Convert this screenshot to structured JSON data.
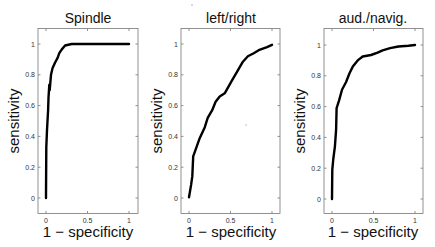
{
  "chart_data": [
    {
      "type": "line",
      "title": "Spindle",
      "xlabel": "1 − specificity",
      "ylabel": "sensitivity",
      "xlim": [
        -0.1,
        1.1
      ],
      "ylim": [
        -0.1,
        1.1
      ],
      "xticks": [
        "0",
        "0.5",
        "1"
      ],
      "yticks": [
        "0",
        "0.2",
        "0.4",
        "0.6",
        "0.8",
        "1"
      ],
      "grid": false,
      "series": [
        {
          "name": "ROC",
          "x": [
            0,
            0,
            0.004,
            0.012,
            0.025,
            0.03,
            0.04,
            0.045,
            0.06,
            0.08,
            0.11,
            0.14,
            0.16,
            0.19,
            0.23,
            0.31,
            0.5,
            1.0
          ],
          "y": [
            0,
            0.02,
            0.33,
            0.44,
            0.57,
            0.65,
            0.735,
            0.7,
            0.8,
            0.845,
            0.88,
            0.91,
            0.94,
            0.965,
            0.99,
            1.0,
            1.0,
            1.0
          ]
        }
      ]
    },
    {
      "type": "line",
      "title": "left/right",
      "xlabel": "1 − specificity",
      "ylabel": "sensitivity",
      "xlim": [
        -0.1,
        1.1
      ],
      "ylim": [
        -0.1,
        1.1
      ],
      "xticks": [
        "0",
        "0.5",
        "1"
      ],
      "yticks": [
        "0",
        "0.2",
        "0.4",
        "0.6",
        "0.8",
        "1"
      ],
      "grid": false,
      "series": [
        {
          "name": "ROC",
          "x": [
            0,
            0.025,
            0.04,
            0.05,
            0.09,
            0.13,
            0.19,
            0.225,
            0.28,
            0.32,
            0.37,
            0.43,
            0.51,
            0.59,
            0.65,
            0.71,
            0.78,
            0.84,
            0.94,
            1.0
          ],
          "y": [
            0.005,
            0.085,
            0.14,
            0.27,
            0.33,
            0.39,
            0.46,
            0.52,
            0.57,
            0.625,
            0.66,
            0.68,
            0.755,
            0.83,
            0.885,
            0.92,
            0.94,
            0.96,
            0.98,
            0.995
          ]
        }
      ]
    },
    {
      "type": "line",
      "title": "aud./navig.",
      "xlabel": "1 − specificity",
      "ylabel": "sensitivity",
      "xlim": [
        -0.1,
        1.1
      ],
      "ylim": [
        -0.1,
        1.1
      ],
      "xticks": [
        "0",
        "0.5",
        "1"
      ],
      "yticks": [
        "0",
        "0.2",
        "0.4",
        "0.6",
        "0.8",
        "1"
      ],
      "grid": false,
      "series": [
        {
          "name": "ROC",
          "x": [
            0,
            0.004,
            0.016,
            0.035,
            0.05,
            0.055,
            0.085,
            0.12,
            0.17,
            0.21,
            0.25,
            0.31,
            0.37,
            0.47,
            0.55,
            0.61,
            0.7,
            0.8,
            0.92,
            1.0
          ],
          "y": [
            0,
            0.19,
            0.26,
            0.34,
            0.45,
            0.59,
            0.64,
            0.71,
            0.76,
            0.815,
            0.86,
            0.9,
            0.925,
            0.935,
            0.95,
            0.965,
            0.98,
            0.99,
            0.995,
            1.0
          ]
        }
      ]
    }
  ],
  "panels": [
    {
      "title": "Spindle",
      "xlabel": "1 − specificity",
      "ylabel": "sensitivity"
    },
    {
      "title": "left/right",
      "xlabel": "1 − specificity",
      "ylabel": "sensitivity"
    },
    {
      "title": "aud./navig.",
      "xlabel": "1 − specificity",
      "ylabel": "sensitivity"
    }
  ],
  "ticks": {
    "x": [
      "0",
      "0.5",
      "1"
    ],
    "y": [
      "0",
      "0.2",
      "0.4",
      "0.6",
      "0.8",
      "1"
    ]
  }
}
